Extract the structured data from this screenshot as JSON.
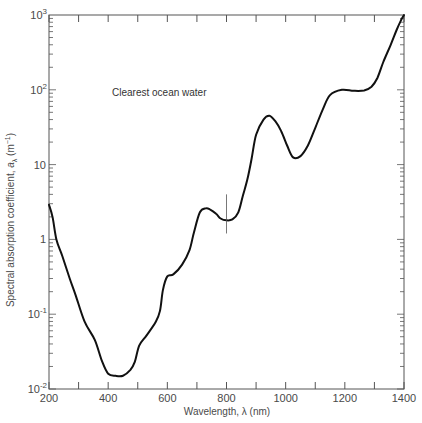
{
  "chart_data": {
    "type": "line",
    "title": "",
    "annotation": "Clearest ocean water",
    "xlabel": "Wavelength, λ (nm)",
    "ylabel": "Spectral absorption coefficient, aλ (m⁻¹)",
    "xlim": [
      200,
      1400
    ],
    "ylim": [
      0.01,
      1000
    ],
    "yscale": "log",
    "grid": false,
    "legend": null,
    "x_ticks": [
      200,
      400,
      600,
      800,
      1000,
      1200,
      1400
    ],
    "x_minor_ticks": [
      300,
      500,
      700,
      900,
      1100,
      1300
    ],
    "y_ticks": [
      {
        "value": 0.01,
        "base": "10",
        "exp": "-2"
      },
      {
        "value": 0.1,
        "base": "10",
        "exp": "-1"
      },
      {
        "value": 1,
        "base": "1",
        "exp": ""
      },
      {
        "value": 10,
        "base": "10",
        "exp": ""
      },
      {
        "value": 100,
        "base": "10",
        "exp": "2"
      },
      {
        "value": 1000,
        "base": "10",
        "exp": "3"
      }
    ],
    "marker_line": {
      "x": 800,
      "y_from": 1.2,
      "y_to": 4.0
    },
    "series": [
      {
        "name": "Clearest ocean water",
        "x": [
          200,
          212,
          225,
          245,
          270,
          290,
          320,
          355,
          380,
          400,
          425,
          450,
          475,
          490,
          505,
          530,
          560,
          575,
          585,
          600,
          620,
          650,
          675,
          690,
          710,
          730,
          745,
          765,
          780,
          800,
          820,
          840,
          855,
          870,
          885,
          900,
          925,
          945,
          965,
          985,
          1005,
          1025,
          1050,
          1075,
          1100,
          1125,
          1150,
          1190,
          1230,
          1265,
          1290,
          1310,
          1330,
          1355,
          1375,
          1390,
          1400
        ],
        "values": [
          2.9,
          2.0,
          1.0,
          0.6,
          0.3,
          0.18,
          0.08,
          0.045,
          0.023,
          0.016,
          0.015,
          0.015,
          0.018,
          0.023,
          0.038,
          0.052,
          0.078,
          0.11,
          0.21,
          0.32,
          0.34,
          0.46,
          0.72,
          1.25,
          2.3,
          2.6,
          2.5,
          2.2,
          1.9,
          1.8,
          1.85,
          2.3,
          3.8,
          6.2,
          12,
          25,
          40,
          45,
          38,
          28,
          18,
          12.5,
          13,
          18,
          31,
          54,
          85,
          100,
          97,
          98,
          110,
          144,
          235,
          400,
          630,
          850,
          1000
        ]
      }
    ]
  }
}
